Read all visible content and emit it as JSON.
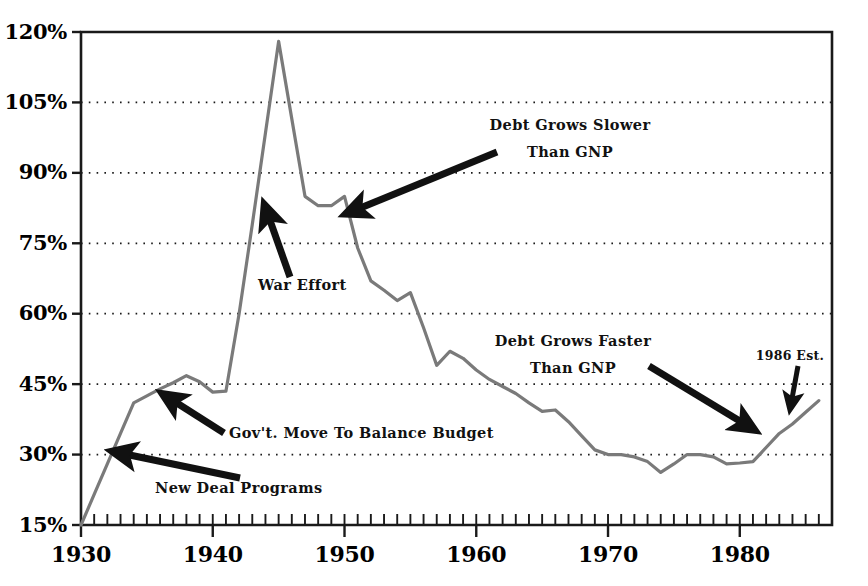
{
  "chart_data": {
    "type": "line",
    "title": "",
    "subtitle": "",
    "xlabel": "",
    "ylabel": "",
    "xlim": [
      1930,
      1987
    ],
    "ylim": [
      15,
      120
    ],
    "grid": true,
    "grid_axis": "y",
    "legend": "none",
    "line_color": "#7a7a7a",
    "axis_color": "#1a1a1a",
    "y_ticks": [
      15,
      30,
      45,
      60,
      75,
      90,
      105,
      120
    ],
    "y_tick_labels": [
      "15%",
      "30%",
      "45%",
      "60%",
      "75%",
      "90%",
      "105%",
      "120%"
    ],
    "x_ticks": [
      1930,
      1940,
      1950,
      1960,
      1970,
      1980
    ],
    "x_tick_labels": [
      "1930",
      "1940",
      "1950",
      "1960",
      "1970",
      "1980"
    ],
    "x_minor_tick_step": 1,
    "series": [
      {
        "name": "Debt as Percent of GNP",
        "x": [
          1930,
          1931,
          1932,
          1933,
          1934,
          1935,
          1936,
          1937,
          1938,
          1939,
          1940,
          1941,
          1942,
          1943,
          1944,
          1945,
          1946,
          1947,
          1948,
          1949,
          1950,
          1951,
          1952,
          1953,
          1954,
          1955,
          1956,
          1957,
          1958,
          1959,
          1960,
          1961,
          1962,
          1963,
          1964,
          1965,
          1966,
          1967,
          1968,
          1969,
          1970,
          1971,
          1972,
          1973,
          1974,
          1975,
          1976,
          1977,
          1978,
          1979,
          1980,
          1981,
          1982,
          1983,
          1984,
          1985,
          1986
        ],
        "values": [
          15.0,
          21.5,
          28.0,
          34.5,
          41.0,
          42.5,
          44.0,
          45.3,
          46.8,
          45.5,
          43.3,
          43.5,
          60.0,
          79.0,
          98.5,
          118.0,
          101.5,
          85.0,
          83.0,
          83.0,
          85.0,
          74.0,
          67.0,
          65.0,
          62.8,
          64.5,
          57.0,
          49.0,
          52.0,
          50.5,
          48.0,
          46.0,
          44.5,
          43.0,
          41.0,
          39.2,
          39.5,
          37.0,
          34.0,
          31.0,
          30.0,
          30.0,
          29.5,
          28.5,
          26.2,
          28.0,
          30.0,
          30.0,
          29.5,
          28.0,
          28.2,
          28.5,
          31.5,
          34.5,
          36.5,
          39.0,
          41.5
        ]
      }
    ],
    "annotations": [
      {
        "id": "new-deal-programs",
        "text": "New Deal Programs",
        "text_x": 155,
        "text_y": 493,
        "arrow_from_x": 240,
        "arrow_from_y": 478,
        "arrow_to_x": 120,
        "arrow_to_y": 453
      },
      {
        "id": "govt-move-to-balance-budget",
        "text": "Gov't. Move To Balance Budget",
        "text_x": 229,
        "text_y": 438,
        "arrow_from_x": 224,
        "arrow_from_y": 433,
        "arrow_to_x": 169,
        "arrow_to_y": 398
      },
      {
        "id": "war-effort",
        "text": "War Effort",
        "text_x": 258,
        "text_y": 290,
        "arrow_from_x": 290,
        "arrow_from_y": 277,
        "arrow_to_x": 267,
        "arrow_to_y": 212
      },
      {
        "id": "debt-grows-slower-than-gnp",
        "line1": "Debt Grows Slower",
        "line2": "Than GNP",
        "text_x": 570,
        "text_y": 130,
        "text_y2": 157,
        "arrow_from_x": 497,
        "arrow_from_y": 152,
        "arrow_to_x": 353,
        "arrow_to_y": 211
      },
      {
        "id": "debt-grows-faster-than-gnp",
        "line1": "Debt Grows Faster",
        "line2": "Than GNP",
        "text_x": 573,
        "text_y": 346,
        "text_y2": 373,
        "arrow_from_x": 649,
        "arrow_from_y": 366,
        "arrow_to_x": 748,
        "arrow_to_y": 426
      },
      {
        "id": "1986-estimate",
        "text": "1986 Est.",
        "text_x": 790,
        "text_y": 360,
        "arrow_from_x": 798,
        "arrow_from_y": 366,
        "arrow_to_x": 791,
        "arrow_to_y": 404
      }
    ]
  }
}
